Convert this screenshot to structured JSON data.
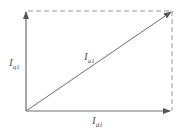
{
  "diagram": {
    "type": "phasor-vector-diagram",
    "colors": {
      "line": "#6e6e6e",
      "dashed": "#9a9a9a",
      "label": "#555555",
      "background": "#ffffff"
    },
    "vectors": [
      {
        "id": "q",
        "label_main": "I",
        "label_sub": "q1",
        "direction": "vertical-up"
      },
      {
        "id": "a",
        "label_main": "I",
        "label_sub": "a1",
        "direction": "diagonal"
      },
      {
        "id": "d",
        "label_main": "I",
        "label_sub": "d1",
        "direction": "horizontal-right"
      }
    ],
    "dashed_edges": [
      "top",
      "right"
    ]
  }
}
